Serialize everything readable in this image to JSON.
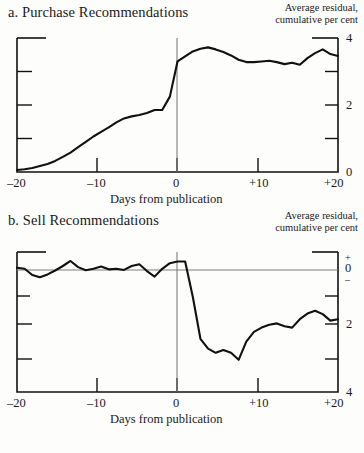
{
  "figure": {
    "background_color": "#fdfdfc",
    "ink_color": "#111111",
    "rule_color": "#8a8a8a"
  },
  "panels": [
    {
      "id": "a",
      "title": "a. Purchase Recommendations",
      "caption_line1": "Average residual,",
      "caption_line2": "cumulative per cent",
      "xaxis_title": "Days from publication",
      "xticks": [
        "–20",
        "–10",
        "0",
        "+10",
        "+20"
      ],
      "yticks": [
        "4",
        "2",
        "0"
      ],
      "event_line_label": "0"
    },
    {
      "id": "b",
      "title": "b. Sell Recommendations",
      "caption_line1": "Average residual,",
      "caption_line2": "cumulative per cent",
      "xaxis_title": "Days from publication",
      "xticks": [
        "–20",
        "–10",
        "0",
        "+10",
        "+20"
      ],
      "yticks": [
        "0",
        "2",
        "4"
      ],
      "y_sign_plus": "+",
      "y_sign_minus": "–",
      "event_line_label": "0"
    }
  ],
  "chart_data": [
    {
      "type": "line",
      "title": "a. Purchase Recommendations",
      "xlabel": "Days from publication",
      "ylabel": "Average residual, cumulative per cent",
      "xlim": [
        -21,
        21
      ],
      "ylim": [
        0,
        4
      ],
      "xticks": [
        -20,
        -10,
        0,
        10,
        20
      ],
      "xticklabels": [
        "–20",
        "–10",
        "0",
        "+10",
        "+20"
      ],
      "yticks": [
        0,
        2,
        4
      ],
      "yticklabels": [
        "0",
        "2",
        "4"
      ],
      "grid": false,
      "legend": "none",
      "annotations": [
        {
          "type": "vline",
          "x": 0,
          "label": "publication day"
        }
      ],
      "series": [
        {
          "name": "Average cumulative residual (purchase recommendations)",
          "x": [
            -21,
            -20,
            -19,
            -18,
            -17,
            -16,
            -15,
            -14,
            -13,
            -12,
            -11,
            -10,
            -9,
            -8,
            -7,
            -6,
            -5,
            -4,
            -3,
            -2,
            -1,
            0,
            1,
            2,
            3,
            4,
            5,
            6,
            7,
            8,
            9,
            10,
            11,
            12,
            13,
            14,
            15,
            16,
            17,
            18,
            19,
            20,
            21
          ],
          "values": [
            0.06,
            0.08,
            0.12,
            0.18,
            0.24,
            0.33,
            0.45,
            0.58,
            0.74,
            0.9,
            1.06,
            1.2,
            1.33,
            1.48,
            1.6,
            1.66,
            1.7,
            1.76,
            1.85,
            1.85,
            2.25,
            3.3,
            3.45,
            3.6,
            3.68,
            3.72,
            3.66,
            3.58,
            3.48,
            3.35,
            3.28,
            3.28,
            3.3,
            3.32,
            3.28,
            3.22,
            3.26,
            3.2,
            3.4,
            3.55,
            3.66,
            3.52,
            3.46
          ]
        }
      ]
    },
    {
      "type": "line",
      "title": "b. Sell Recommendations",
      "xlabel": "Days from publication",
      "ylabel": "Average residual, cumulative per cent",
      "xlim": [
        -21,
        21
      ],
      "ylim": [
        -4.4,
        0.6
      ],
      "xticks": [
        -20,
        -10,
        0,
        10,
        20
      ],
      "xticklabels": [
        "–20",
        "–10",
        "0",
        "+10",
        "+20"
      ],
      "yticks": [
        0,
        -2,
        -4
      ],
      "yticklabels": [
        "0",
        "2",
        "4"
      ],
      "y_axis_note": "axis reads downward: + above 0, – below 0",
      "grid": false,
      "legend": "none",
      "annotations": [
        {
          "type": "vline",
          "x": 0,
          "label": "publication day"
        },
        {
          "type": "hline",
          "y": 0,
          "label": "zero residual"
        }
      ],
      "series": [
        {
          "name": "Average cumulative residual (sell recommendations)",
          "x": [
            -21,
            -20,
            -19,
            -18,
            -17,
            -16,
            -15,
            -14,
            -13,
            -12,
            -11,
            -10,
            -9,
            -8,
            -7,
            -6,
            -5,
            -4,
            -3,
            -2,
            -1,
            0,
            1,
            2,
            3,
            4,
            5,
            6,
            7,
            8,
            9,
            10,
            11,
            12,
            13,
            14,
            15,
            16,
            17,
            18,
            19,
            20,
            21
          ],
          "values": [
            0.04,
            0.0,
            -0.22,
            -0.3,
            -0.2,
            -0.06,
            0.1,
            0.28,
            0.06,
            -0.05,
            0.0,
            0.08,
            -0.02,
            0.0,
            -0.04,
            0.1,
            0.16,
            -0.08,
            -0.28,
            0.0,
            0.2,
            0.26,
            0.26,
            -1.0,
            -2.5,
            -2.85,
            -3.0,
            -2.9,
            -3.0,
            -3.25,
            -2.6,
            -2.25,
            -2.1,
            -2.0,
            -1.95,
            -2.05,
            -2.1,
            -1.8,
            -1.6,
            -1.5,
            -1.62,
            -1.85,
            -1.8
          ]
        }
      ]
    }
  ]
}
